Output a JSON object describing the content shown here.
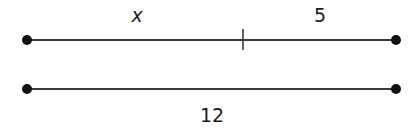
{
  "diagram": {
    "type": "segment-diagram",
    "colors": {
      "stroke": "#3a3a3a",
      "point": "#111111",
      "text": "#1a1a1a"
    },
    "top_segment": {
      "left_part_label": "x",
      "right_part_label": "5",
      "has_division_tick": true
    },
    "bottom_segment": {
      "length_label": "12"
    }
  }
}
